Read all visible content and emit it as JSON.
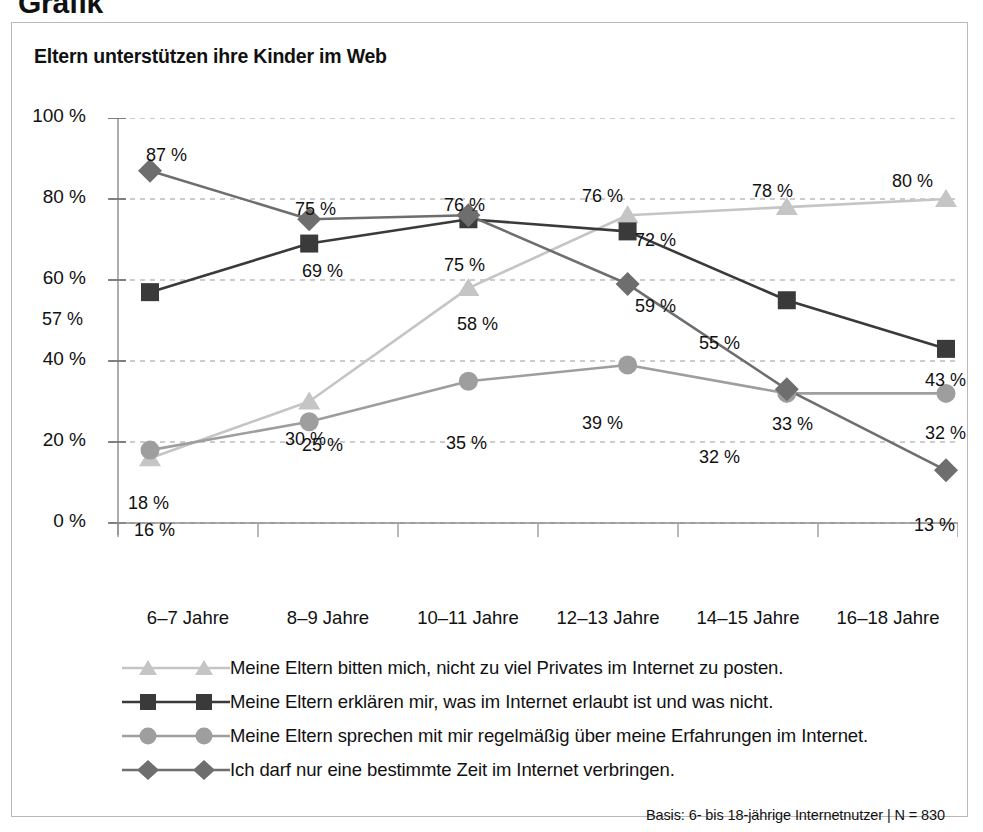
{
  "page_heading": "Grafik",
  "card": {
    "title": "Eltern unterstützen ihre Kinder im Web",
    "footnote": "Basis: 6- bis 18-jährige Internetnutzer | N = 830"
  },
  "chart_data": {
    "type": "line",
    "title": "Eltern unterstützen ihre Kinder im Web",
    "xlabel": "",
    "ylabel": "",
    "ylim": [
      0,
      100
    ],
    "ytick_labels": [
      "0 %",
      "20 %",
      "40 %",
      "60 %",
      "80 %",
      "100 %"
    ],
    "yticks": [
      0,
      20,
      40,
      60,
      80,
      100
    ],
    "grid": true,
    "legend_position": "below",
    "categories": [
      "6–7 Jahre",
      "8–9 Jahre",
      "10–11 Jahre",
      "12–13 Jahre",
      "14–15 Jahre",
      "16–18 Jahre"
    ],
    "series": [
      {
        "name": "Meine Eltern bitten mich, nicht zu viel Privates im Internet zu posten.",
        "marker": "triangle",
        "color": "#c5c5c5",
        "values": [
          16,
          30,
          58,
          76,
          78,
          80
        ],
        "labels": [
          "16 %",
          "30 %",
          "58 %",
          "76 %",
          "78 %",
          "80 %"
        ]
      },
      {
        "name": "Meine Eltern erklären mir, was im Internet erlaubt ist und was nicht.",
        "marker": "square",
        "color": "#3a3a3a",
        "values": [
          57,
          69,
          75,
          72,
          55,
          43
        ],
        "labels": [
          "57 %",
          "69 %",
          "75 %",
          "72 %",
          "55 %",
          "43 %"
        ]
      },
      {
        "name": "Meine Eltern sprechen mit mir regelmäßig über meine Erfahrungen im Internet.",
        "marker": "circle",
        "color": "#9e9e9e",
        "values": [
          18,
          25,
          35,
          39,
          32,
          32
        ],
        "labels": [
          "18 %",
          "25 %",
          "35 %",
          "39 %",
          "32 %",
          "32 %"
        ]
      },
      {
        "name": "Ich darf nur eine bestimmte Zeit im Internet verbringen.",
        "marker": "diamond",
        "color": "#6e6e6e",
        "values": [
          87,
          75,
          76,
          59,
          33,
          13
        ],
        "labels": [
          "87 %",
          "75 %",
          "76 %",
          "59 %",
          "33 %",
          "13 %"
        ]
      }
    ],
    "point_labels": [
      {
        "text": "87 %",
        "x": 134,
        "y": 122
      },
      {
        "text": "75 %",
        "x": 283,
        "y": 176
      },
      {
        "text": "76 %",
        "x": 432,
        "y": 172
      },
      {
        "text": "76 %",
        "x": 570,
        "y": 163
      },
      {
        "text": "59 %",
        "x": 623,
        "y": 273
      },
      {
        "text": "33 %",
        "x": 760,
        "y": 391
      },
      {
        "text": "13 %",
        "x": 902,
        "y": 492
      },
      {
        "text": "57 %",
        "x": 30,
        "y": 286
      },
      {
        "text": "69 %",
        "x": 290,
        "y": 238
      },
      {
        "text": "75 %",
        "x": 432,
        "y": 232
      },
      {
        "text": "72 %",
        "x": 623,
        "y": 207
      },
      {
        "text": "55 %",
        "x": 687,
        "y": 310
      },
      {
        "text": "43 %",
        "x": 913,
        "y": 347
      },
      {
        "text": "18 %",
        "x": 116,
        "y": 470
      },
      {
        "text": "25 %",
        "x": 290,
        "y": 412
      },
      {
        "text": "35 %",
        "x": 434,
        "y": 410
      },
      {
        "text": "39 %",
        "x": 570,
        "y": 390
      },
      {
        "text": "32 %",
        "x": 687,
        "y": 424
      },
      {
        "text": "32 %",
        "x": 913,
        "y": 400
      },
      {
        "text": "16 %",
        "x": 122,
        "y": 497
      },
      {
        "text": "30 %",
        "x": 273,
        "y": 406
      },
      {
        "text": "58 %",
        "x": 445,
        "y": 291
      },
      {
        "text": "78 %",
        "x": 740,
        "y": 158
      },
      {
        "text": "80 %",
        "x": 880,
        "y": 148
      }
    ]
  }
}
